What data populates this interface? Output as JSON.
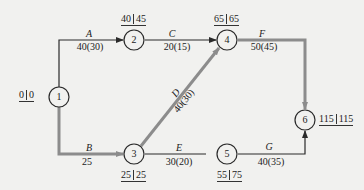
{
  "colors": {
    "background": "#f1f1ef",
    "normal_arrow": "#2a2a2a",
    "critical_arrow": "#8c8c8c",
    "node_stroke": "#2a2a2a",
    "text": "#222222"
  },
  "nodes": [
    {
      "id": "1",
      "label": "1",
      "cx": 59,
      "cy": 97,
      "times": {
        "early": "0",
        "late": "0"
      }
    },
    {
      "id": "2",
      "label": "2",
      "cx": 134,
      "cy": 40,
      "times": {
        "early": "40",
        "late": "45"
      }
    },
    {
      "id": "3",
      "label": "3",
      "cx": 134,
      "cy": 154,
      "times": {
        "early": "25",
        "late": "25"
      }
    },
    {
      "id": "4",
      "label": "4",
      "cx": 227,
      "cy": 40,
      "times": {
        "early": "65",
        "late": "65"
      }
    },
    {
      "id": "5",
      "label": "5",
      "cx": 227,
      "cy": 154,
      "times": {
        "early": "55",
        "late": "75"
      }
    },
    {
      "id": "6",
      "label": "6",
      "cx": 305,
      "cy": 120,
      "times": {
        "early": "115",
        "late": "115"
      }
    }
  ],
  "activities": [
    {
      "name": "A",
      "from": "1",
      "to": "2",
      "duration": "40(30)",
      "critical": false
    },
    {
      "name": "B",
      "from": "1",
      "to": "3",
      "duration": "25",
      "critical": true
    },
    {
      "name": "C",
      "from": "2",
      "to": "4",
      "duration": "20(15)",
      "critical": false
    },
    {
      "name": "D",
      "from": "3",
      "to": "4",
      "duration": "40(30)",
      "critical": true
    },
    {
      "name": "E",
      "from": "3",
      "to": "5",
      "duration": "30(20)",
      "critical": false
    },
    {
      "name": "F",
      "from": "4",
      "to": "6",
      "duration": "50(45)",
      "critical": true
    },
    {
      "name": "G",
      "from": "5",
      "to": "6",
      "duration": "40(35)",
      "critical": false
    }
  ]
}
